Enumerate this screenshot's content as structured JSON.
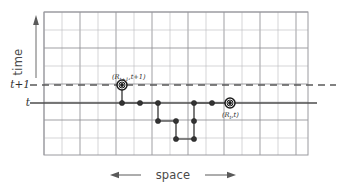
{
  "figure": {
    "type": "diagram",
    "background": "#ffffff"
  },
  "colors": {
    "grid_minor": "#b9b9bd",
    "grid_major": "#8e8e93",
    "plot_border": "#9a9a9f",
    "time_line": "#4d4d4d",
    "dashed_line": "#5a5a5a",
    "walk_line": "#5b5b5b",
    "node_fill": "#333333",
    "marker_ring": "#1a1a1a",
    "text": "#3b3b3b"
  },
  "axes": {
    "y_label": "time",
    "y_arrow": "arrow-up",
    "x_label": "space",
    "x_arrow": "arrow-double-horizontal",
    "tick_labels": [
      {
        "text": "t+1",
        "y": 85
      },
      {
        "text": "t",
        "y": 103
      }
    ]
  },
  "grid": {
    "x_start": 44,
    "x_end": 308,
    "y_start": 12,
    "y_end": 155,
    "step": 18,
    "columns": 15,
    "rows": 8
  },
  "reference_lines": [
    {
      "name": "t-plus-1-dashed",
      "label": "t+1",
      "y": 85,
      "style": "dashed",
      "x1": 30,
      "x2": 336
    },
    {
      "name": "t-solid",
      "label": "t",
      "y": 103,
      "style": "solid",
      "x1": 30,
      "x2": 317
    }
  ],
  "walk": {
    "description": "lattice random walk path in space-time",
    "nodes": [
      {
        "x": 122,
        "y": 103
      },
      {
        "x": 140,
        "y": 103
      },
      {
        "x": 158,
        "y": 103
      },
      {
        "x": 158,
        "y": 121
      },
      {
        "x": 176,
        "y": 121
      },
      {
        "x": 176,
        "y": 139
      },
      {
        "x": 194,
        "y": 139
      },
      {
        "x": 194,
        "y": 121
      },
      {
        "x": 194,
        "y": 103
      },
      {
        "x": 212,
        "y": 103
      },
      {
        "x": 230,
        "y": 103
      }
    ],
    "segments": [
      {
        "x1": 122,
        "y1": 103,
        "x2": 158,
        "y2": 103
      },
      {
        "x1": 158,
        "y1": 103,
        "x2": 158,
        "y2": 121
      },
      {
        "x1": 158,
        "y1": 121,
        "x2": 176,
        "y2": 121
      },
      {
        "x1": 176,
        "y1": 121,
        "x2": 176,
        "y2": 139
      },
      {
        "x1": 176,
        "y1": 139,
        "x2": 194,
        "y2": 139
      },
      {
        "x1": 194,
        "y1": 139,
        "x2": 194,
        "y2": 103
      },
      {
        "x1": 194,
        "y1": 103,
        "x2": 230,
        "y2": 103
      },
      {
        "x1": 122,
        "y1": 85,
        "x2": 122,
        "y2": 103
      }
    ]
  },
  "markers": [
    {
      "name": "marker-r-t-plus-1",
      "x": 122,
      "y": 85,
      "label": "(R",
      "label_sub": "t+1",
      "label_tail": ",t+1)",
      "label_x": 112,
      "label_y": 79
    },
    {
      "name": "marker-r-t",
      "x": 230,
      "y": 103,
      "label": "(R",
      "label_sub": "t",
      "label_tail": ",t)",
      "label_x": 222,
      "label_y": 117
    }
  ]
}
